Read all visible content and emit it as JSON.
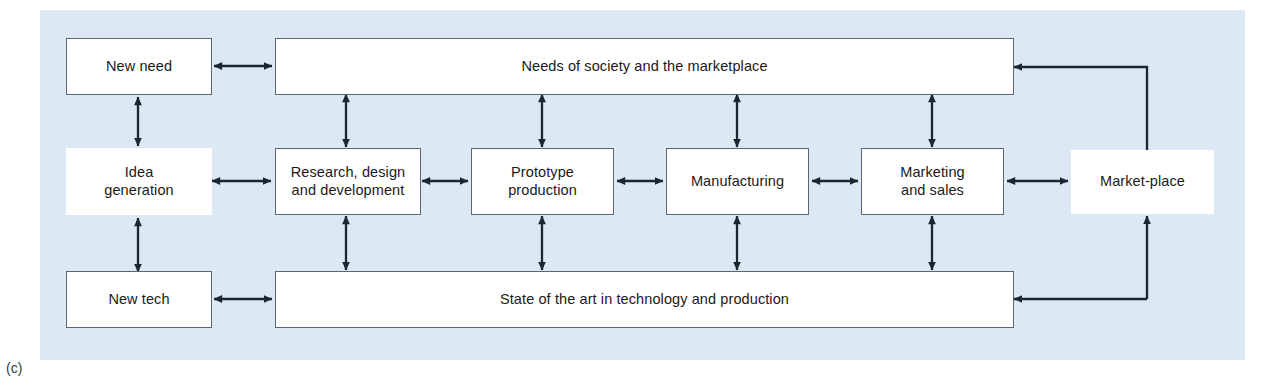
{
  "figure": {
    "caption": "(c)",
    "panel_color": "#dce8f4",
    "box_fill": "#ffffff",
    "box_border_color": "#5a6672",
    "line_color": "#1a2733"
  },
  "nodes": {
    "new_need": "New need",
    "needs_of_society": "Needs of society and the marketplace",
    "idea_generation": "Idea\ngeneration",
    "research_design": "Research, design\nand development",
    "prototype_production": "Prototype\nproduction",
    "manufacturing": "Manufacturing",
    "marketing_sales": "Marketing\nand sales",
    "market_place": "Market-place",
    "new_tech": "New tech",
    "state_of_the_art": "State of the art in technology and production"
  },
  "connections": [
    {
      "from": "new_need",
      "to": "needs_of_society",
      "style": "double-horizontal"
    },
    {
      "from": "new_need",
      "to": "idea_generation",
      "style": "double-vertical"
    },
    {
      "from": "idea_generation",
      "to": "new_tech",
      "style": "double-vertical"
    },
    {
      "from": "new_tech",
      "to": "state_of_the_art",
      "style": "double-horizontal"
    },
    {
      "from": "idea_generation",
      "to": "research_design",
      "style": "double-horizontal"
    },
    {
      "from": "research_design",
      "to": "prototype_production",
      "style": "double-horizontal"
    },
    {
      "from": "prototype_production",
      "to": "manufacturing",
      "style": "double-horizontal"
    },
    {
      "from": "manufacturing",
      "to": "marketing_sales",
      "style": "double-horizontal"
    },
    {
      "from": "marketing_sales",
      "to": "market_place",
      "style": "double-horizontal"
    },
    {
      "from": "needs_of_society",
      "to": "research_design",
      "style": "double-vertical"
    },
    {
      "from": "needs_of_society",
      "to": "prototype_production",
      "style": "double-vertical"
    },
    {
      "from": "needs_of_society",
      "to": "manufacturing",
      "style": "double-vertical"
    },
    {
      "from": "needs_of_society",
      "to": "marketing_sales",
      "style": "double-vertical"
    },
    {
      "from": "research_design",
      "to": "state_of_the_art",
      "style": "double-vertical"
    },
    {
      "from": "prototype_production",
      "to": "state_of_the_art",
      "style": "double-vertical"
    },
    {
      "from": "manufacturing",
      "to": "state_of_the_art",
      "style": "double-vertical"
    },
    {
      "from": "marketing_sales",
      "to": "state_of_the_art",
      "style": "double-vertical"
    },
    {
      "from": "market_place",
      "to": "needs_of_society",
      "style": "elbow-single-arrow"
    },
    {
      "from": "market_place",
      "to": "state_of_the_art",
      "style": "elbow-single-arrow"
    }
  ]
}
